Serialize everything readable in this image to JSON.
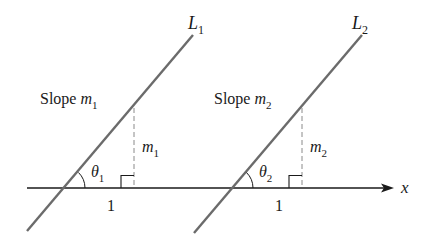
{
  "diagram": {
    "type": "geometry",
    "axis": {
      "label": "x"
    },
    "lines": [
      {
        "name": "L",
        "subscript": "1",
        "slope_text": "Slope ",
        "slope_var": "m",
        "slope_sub": "1",
        "rise_var": "m",
        "rise_sub": "1",
        "angle_var": "θ",
        "angle_sub": "1",
        "run_label": "1"
      },
      {
        "name": "L",
        "subscript": "2",
        "slope_text": "Slope ",
        "slope_var": "m",
        "slope_sub": "2",
        "rise_var": "m",
        "rise_sub": "2",
        "angle_var": "θ",
        "angle_sub": "2",
        "run_label": "1"
      }
    ],
    "colors": {
      "line": "#6b6b6b",
      "axis": "#1a1a1a",
      "dashed": "#888888",
      "text": "#1a1a1a"
    }
  }
}
